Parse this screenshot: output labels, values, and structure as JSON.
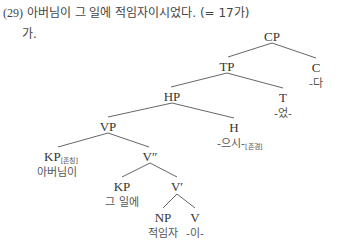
{
  "example": {
    "number": "(29)",
    "sentence": "아버님이 그 일에 적임자이시었다.",
    "note": "(= 17가)",
    "sub_label": "가."
  },
  "tree": {
    "nodes": {
      "CP": {
        "label": "CP"
      },
      "TP": {
        "label": "TP"
      },
      "C": {
        "label": "C",
        "lex": "-다"
      },
      "HP": {
        "label": "HP"
      },
      "T": {
        "label": "T",
        "lex": "-었-"
      },
      "VP": {
        "label": "VP"
      },
      "H": {
        "label": "H",
        "lex": "-으시-",
        "feature": "[존경]"
      },
      "KP_subj": {
        "label": "KP",
        "feature": "[존칭]",
        "lex": "아버님이"
      },
      "V2": {
        "label": "V″"
      },
      "KP_obj": {
        "label": "KP",
        "lex": "그 일에"
      },
      "V1": {
        "label": "V′"
      },
      "NP": {
        "label": "NP",
        "lex": "적임자"
      },
      "V": {
        "label": "V",
        "lex": "-이-"
      }
    },
    "edges": [
      [
        "CP",
        "TP"
      ],
      [
        "CP",
        "C"
      ],
      [
        "TP",
        "HP"
      ],
      [
        "TP",
        "T"
      ],
      [
        "HP",
        "VP"
      ],
      [
        "HP",
        "H"
      ],
      [
        "VP",
        "KP_subj"
      ],
      [
        "VP",
        "V2"
      ],
      [
        "V2",
        "KP_obj"
      ],
      [
        "V2",
        "V1"
      ],
      [
        "V1",
        "NP"
      ],
      [
        "V1",
        "V"
      ]
    ]
  }
}
